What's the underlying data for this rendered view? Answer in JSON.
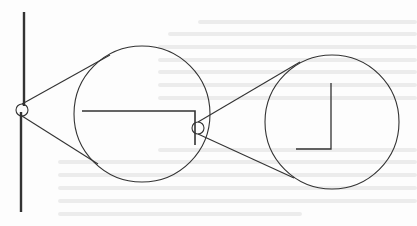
{
  "figure": {
    "colors": {
      "background": "#fdfdfd",
      "stroke": "#333333",
      "bleed_through": "#e6e6e6"
    },
    "shaft": {
      "x": 23,
      "y1": 12,
      "y2": 212,
      "width": 2.2
    },
    "small_pulleys": [
      {
        "id": "left-pivot",
        "cx": 22,
        "cy": 110,
        "r": 6
      },
      {
        "id": "middle-pivot",
        "cx": 198,
        "cy": 128,
        "r": 6
      }
    ],
    "large_wheels": [
      {
        "id": "wheel-1",
        "cx": 142,
        "cy": 114,
        "r": 68
      },
      {
        "id": "wheel-2",
        "cx": 332,
        "cy": 122,
        "r": 67
      }
    ],
    "belts": [
      {
        "id": "belt-1-upper",
        "x1": 22,
        "y1": 104,
        "x2": 110,
        "y2": 55
      },
      {
        "id": "belt-1-lower",
        "x1": 22,
        "y1": 116,
        "x2": 98,
        "y2": 164
      },
      {
        "id": "belt-2-upper",
        "x1": 198,
        "y1": 122,
        "x2": 300,
        "y2": 62
      },
      {
        "id": "belt-2-lower",
        "x1": 198,
        "y1": 134,
        "x2": 294,
        "y2": 178
      }
    ],
    "arms": [
      {
        "id": "arm-1",
        "points": "82,111 195,111 195,145"
      },
      {
        "id": "arm-2",
        "points": "331,83 331,149 296,149"
      }
    ]
  }
}
